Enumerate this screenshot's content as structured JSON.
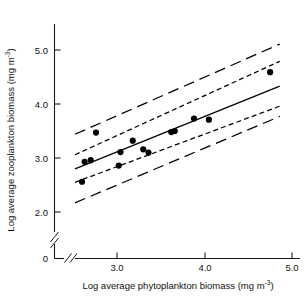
{
  "figure": {
    "background": "#ffffff",
    "ink_color": "#000000"
  },
  "chart_data": {
    "type": "scatter",
    "title": "",
    "subtitle": "",
    "xlabel": "Log average phytoplankton biomass (mg m",
    "xlabel_exponent": "-3",
    "xlabel_tail": ")",
    "ylabel": "Log average zooplankton biomass (mg m",
    "ylabel_exponent": "-3",
    "ylabel_tail": ")",
    "xlim": [
      2.42,
      5.05
    ],
    "ylim": [
      1.85,
      5.25
    ],
    "x_origin_label": "0",
    "y_origin_label": "0",
    "xticks": [
      3.0,
      4.0,
      5.0
    ],
    "xtick_labels": [
      "3.0",
      "4.0",
      "5.0"
    ],
    "yticks": [
      2.0,
      3.0,
      4.0,
      5.0
    ],
    "ytick_labels": [
      "2.0",
      "3.0",
      "4.0",
      "5.0"
    ],
    "axis_break_x": true,
    "axis_break_y": true,
    "grid": false,
    "legend": "none",
    "points": [
      {
        "x": 2.6,
        "y": 2.56
      },
      {
        "x": 2.63,
        "y": 2.93
      },
      {
        "x": 2.7,
        "y": 2.96
      },
      {
        "x": 2.76,
        "y": 3.47
      },
      {
        "x": 3.02,
        "y": 2.86
      },
      {
        "x": 3.04,
        "y": 3.11
      },
      {
        "x": 3.18,
        "y": 3.32
      },
      {
        "x": 3.3,
        "y": 3.16
      },
      {
        "x": 3.36,
        "y": 3.1
      },
      {
        "x": 3.62,
        "y": 3.48
      },
      {
        "x": 3.66,
        "y": 3.5
      },
      {
        "x": 3.88,
        "y": 3.73
      },
      {
        "x": 4.05,
        "y": 3.71
      },
      {
        "x": 4.75,
        "y": 4.59
      }
    ],
    "regression_line": {
      "name": "fitted regression",
      "style": "solid",
      "x_start": 2.52,
      "y_start": 2.8,
      "x_end": 4.86,
      "y_end": 4.33
    },
    "confidence_band": {
      "name": "95% confidence limits for the mean",
      "style": "short-dash",
      "upper": {
        "x_start": 2.52,
        "y_start": 3.06,
        "x_end": 4.86,
        "y_end": 4.79
      },
      "lower": {
        "x_start": 2.52,
        "y_start": 2.55,
        "x_end": 4.86,
        "y_end": 3.96
      }
    },
    "prediction_band": {
      "name": "95% prediction limits for individuals",
      "style": "long-dash",
      "upper": {
        "x_start": 2.52,
        "y_start": 3.44,
        "x_end": 4.86,
        "y_end": 5.11
      },
      "lower": {
        "x_start": 2.52,
        "y_start": 2.17,
        "x_end": 4.86,
        "y_end": 3.77
      }
    }
  }
}
